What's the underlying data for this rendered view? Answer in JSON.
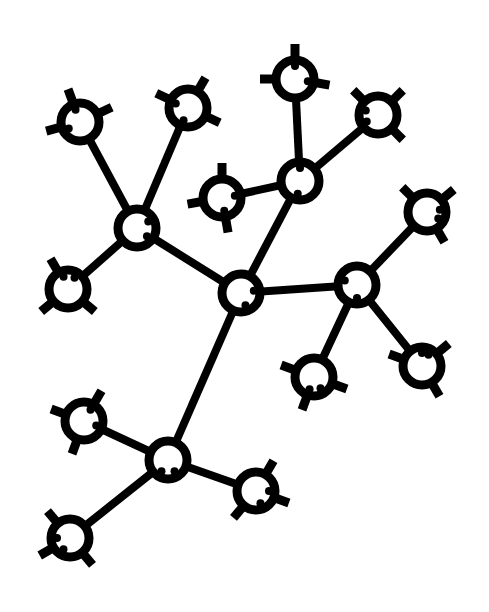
{
  "diagram": {
    "type": "branched-molecule",
    "colors": {
      "stroke": "#000000",
      "background": "#ffffff"
    },
    "node_radius": 19,
    "ring_width": 9,
    "bond_width": 8,
    "nodes": [
      {
        "id": "C",
        "x": 241,
        "y": 293,
        "role": "core",
        "spokes": [],
        "notches": [
          70,
          350
        ]
      },
      {
        "id": "A",
        "x": 137,
        "y": 228,
        "role": "branch",
        "spokes": [],
        "notches": [
          40,
          330
        ]
      },
      {
        "id": "B",
        "x": 300,
        "y": 181,
        "role": "branch",
        "spokes": [],
        "notches": [
          100,
          270
        ]
      },
      {
        "id": "D",
        "x": 357,
        "y": 285,
        "role": "branch",
        "spokes": [],
        "notches": [
          90,
          200
        ]
      },
      {
        "id": "E",
        "x": 168,
        "y": 460,
        "role": "branch",
        "spokes": [],
        "notches": [
          60,
          120
        ]
      },
      {
        "id": "A1",
        "x": 80,
        "y": 122,
        "role": "leaf",
        "spokes": [
          250,
          335,
          165
        ],
        "notches": [
          250,
          150
        ]
      },
      {
        "id": "A2",
        "x": 188,
        "y": 108,
        "role": "leaf",
        "spokes": [
          205,
          300,
          25
        ],
        "notches": [
          110,
          200
        ]
      },
      {
        "id": "A3",
        "x": 68,
        "y": 289,
        "role": "leaf",
        "spokes": [
          240,
          140,
          40
        ],
        "notches": [
          300,
          250
        ]
      },
      {
        "id": "B1",
        "x": 295,
        "y": 79,
        "role": "leaf",
        "spokes": [
          270,
          10,
          180
        ],
        "notches": [
          270,
          10
        ]
      },
      {
        "id": "B2",
        "x": 378,
        "y": 115,
        "role": "leaf",
        "spokes": [
          225,
          315,
          45
        ],
        "notches": [
          200,
          150
        ]
      },
      {
        "id": "B3",
        "x": 222,
        "y": 198,
        "role": "leaf",
        "spokes": [
          270,
          170,
          80
        ],
        "notches": [
          350,
          80
        ]
      },
      {
        "id": "D1",
        "x": 427,
        "y": 212,
        "role": "leaf",
        "spokes": [
          225,
          320,
          60
        ],
        "notches": [
          350,
          30
        ]
      },
      {
        "id": "D2",
        "x": 314,
        "y": 377,
        "role": "leaf",
        "spokes": [
          200,
          110,
          20
        ],
        "notches": [
          60,
          110
        ]
      },
      {
        "id": "D3",
        "x": 422,
        "y": 366,
        "role": "leaf",
        "spokes": [
          320,
          200,
          60
        ],
        "notches": [
          270,
          300
        ]
      },
      {
        "id": "E1",
        "x": 84,
        "y": 421,
        "role": "leaf",
        "spokes": [
          200,
          300,
          110
        ],
        "notches": [
          300,
          20
        ]
      },
      {
        "id": "E2",
        "x": 256,
        "y": 491,
        "role": "leaf",
        "spokes": [
          300,
          20,
          130
        ],
        "notches": [
          70,
          0
        ]
      },
      {
        "id": "E3",
        "x": 70,
        "y": 538,
        "role": "leaf",
        "spokes": [
          230,
          150,
          50
        ],
        "notches": [
          120,
          180
        ]
      }
    ],
    "bonds": [
      [
        "C",
        "A"
      ],
      [
        "C",
        "B"
      ],
      [
        "C",
        "D"
      ],
      [
        "C",
        "E"
      ],
      [
        "A",
        "A1"
      ],
      [
        "A",
        "A2"
      ],
      [
        "A",
        "A3"
      ],
      [
        "B",
        "B1"
      ],
      [
        "B",
        "B2"
      ],
      [
        "B",
        "B3"
      ],
      [
        "D",
        "D1"
      ],
      [
        "D",
        "D2"
      ],
      [
        "D",
        "D3"
      ],
      [
        "E",
        "E1"
      ],
      [
        "E",
        "E2"
      ],
      [
        "E",
        "E3"
      ]
    ]
  }
}
